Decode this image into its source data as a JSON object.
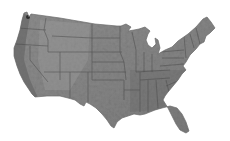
{
  "map": {
    "subject": "Contiguous United States",
    "style": "grayscale shaded relief with state borders",
    "background": "#ffffff",
    "land_fill": "#8a8a8a",
    "land_fill_dark": "#6e6e6e",
    "land_fill_light": "#a3a3a3",
    "border_color": "#4a4a4a",
    "regions": [
      {
        "name": "Pacific Northwest"
      },
      {
        "name": "California"
      },
      {
        "name": "Mountain West"
      },
      {
        "name": "Great Plains"
      },
      {
        "name": "Texas"
      },
      {
        "name": "Midwest"
      },
      {
        "name": "Great Lakes"
      },
      {
        "name": "Northeast"
      },
      {
        "name": "Southeast"
      },
      {
        "name": "Florida"
      }
    ]
  }
}
